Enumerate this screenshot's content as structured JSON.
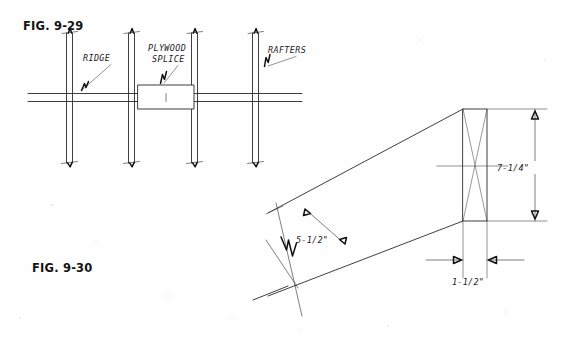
{
  "page": {
    "background_color": "#fefefe",
    "ink_color": "#1d1d1d",
    "width": 578,
    "height": 340,
    "document_type": "technical-line-drawing"
  },
  "figures": [
    {
      "id": "fig-9-29",
      "caption": "FIG. 9-29",
      "subject": "ridge board with rafters and plywood splice",
      "callouts": [
        {
          "id": "ridge",
          "text": "RIDGE"
        },
        {
          "id": "plywood-splice",
          "line1": "PLYWOOD",
          "line2": "SPLICE"
        },
        {
          "id": "rafters",
          "text": "RAFTERS"
        }
      ],
      "rafter_count": 4
    },
    {
      "id": "fig-9-30",
      "caption": "FIG. 9-30",
      "subject": "perspective view of dimensional lumber rafter stock",
      "dimensions": [
        {
          "id": "width-face",
          "value": "5-1/2\"",
          "orientation": "diagonal"
        },
        {
          "id": "depth-end",
          "value": "7-1/4\"",
          "orientation": "vertical"
        },
        {
          "id": "thickness",
          "value": "1-1/2\"",
          "orientation": "horizontal"
        }
      ]
    }
  ]
}
